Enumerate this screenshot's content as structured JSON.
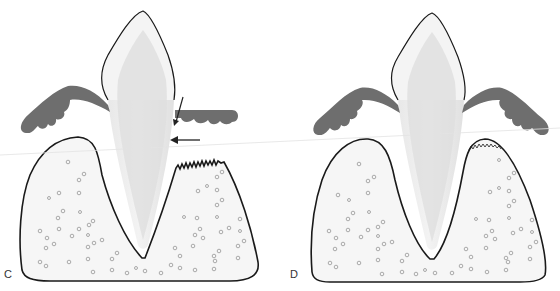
{
  "figure": {
    "panels": [
      {
        "id": "C",
        "label": "C",
        "description": "Tooth with gingiva on both sides; right side shows arrows pointing to root surface and a jagged (resorbed) alveolar crest"
      },
      {
        "id": "D",
        "label": "D",
        "description": "Tooth with symmetric gingiva on both sides; right alveolar crest shows healed fine serrated margin"
      }
    ],
    "colors": {
      "outline": "#1a1a1a",
      "gingiva": "#6e6e6e",
      "tooth_enamel": "#f2f2f2",
      "tooth_dentin": "#dcdcdc",
      "bone_fill": "#f6f6f6",
      "bone_marrow_circles": "#8a8a8a",
      "arrow": "#222222",
      "scan_line": "#e4e4e4"
    }
  }
}
